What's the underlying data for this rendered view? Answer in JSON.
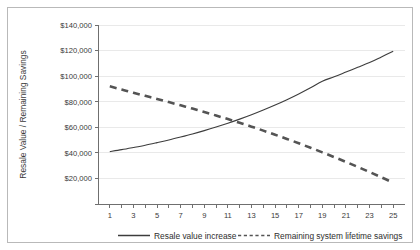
{
  "chart_data": {
    "type": "line",
    "title": "",
    "xlabel": "",
    "ylabel": "Resale Value / Remaining Savings",
    "xlim": [
      0,
      26
    ],
    "ylim": [
      0,
      140000
    ],
    "grid": true,
    "legend_position": "bottom",
    "x": [
      1,
      2,
      3,
      4,
      5,
      6,
      7,
      8,
      9,
      10,
      11,
      12,
      13,
      14,
      15,
      16,
      17,
      18,
      19,
      20,
      21,
      22,
      23,
      24,
      25
    ],
    "xticks": [
      1,
      2,
      3,
      4,
      5,
      6,
      7,
      8,
      9,
      10,
      11,
      12,
      13,
      14,
      15,
      16,
      17,
      18,
      19,
      20,
      21,
      22,
      23,
      24,
      25
    ],
    "xtick_labels": [
      "1",
      "",
      "3",
      "",
      "5",
      "",
      "7",
      "",
      "9",
      "",
      "11",
      "",
      "13",
      "",
      "15",
      "",
      "17",
      "",
      "19",
      "",
      "21",
      "",
      "23",
      "",
      "25"
    ],
    "yticks": [
      0,
      20000,
      40000,
      60000,
      80000,
      100000,
      120000,
      140000
    ],
    "ytick_labels": [
      "",
      "$20,000",
      "$40,000",
      "$60,000",
      "$80,000",
      "$100,000",
      "$120,000",
      "$140,000"
    ],
    "series": [
      {
        "name": "Resale value increase",
        "style": "solid",
        "color": "#3d3d3d",
        "values": [
          41000,
          42500,
          44200,
          46000,
          48000,
          50100,
          52400,
          54800,
          57400,
          60200,
          63200,
          66400,
          69800,
          73500,
          77400,
          81600,
          86100,
          90900,
          96000,
          99500,
          103200,
          106900,
          110600,
          115000,
          119500
        ]
      },
      {
        "name": "Remaining system lifetime savings",
        "style": "dashed",
        "color": "#545454",
        "values": [
          92000,
          89500,
          87000,
          84600,
          82200,
          79700,
          77200,
          74600,
          72000,
          69200,
          66400,
          63500,
          60500,
          57400,
          54200,
          50900,
          47500,
          44000,
          40400,
          36700,
          32900,
          29000,
          25000,
          20900,
          16700
        ]
      }
    ],
    "legend": [
      {
        "label": "Resale value increase",
        "style": "solid",
        "color": "#3d3d3d"
      },
      {
        "label": "Remaining system lifetime savings",
        "style": "dashed",
        "color": "#545454"
      }
    ]
  }
}
